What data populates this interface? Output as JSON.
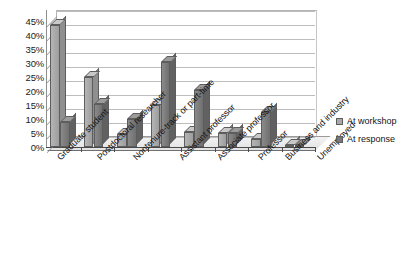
{
  "chart_data": {
    "type": "bar",
    "title": "",
    "xlabel": "",
    "ylabel": "",
    "ylim": [
      0,
      45
    ],
    "ytick_step": 5,
    "grid": true,
    "legend_position": "right",
    "style": "3d-clustered-column",
    "categories": [
      "Graduate student",
      "Postdoctoral researcher",
      "Nontenure-track or part-time",
      "Assistant professor",
      "Associate professor",
      "Professor",
      "Business and industry",
      "Unemployed"
    ],
    "ytick_labels": [
      "0%",
      "5%",
      "10%",
      "15%",
      "20%",
      "25%",
      "30%",
      "35%",
      "40%",
      "45%"
    ],
    "series": [
      {
        "name": "At workshop",
        "color": "#a8a8a8",
        "values": [
          43.5,
          25.0,
          4.5,
          15.0,
          5.5,
          5.0,
          3.0,
          0.7
        ]
      },
      {
        "name": "At response",
        "color": "#787878",
        "values": [
          9.0,
          15.5,
          10.0,
          30.5,
          20.5,
          5.0,
          12.5,
          0.7
        ]
      }
    ]
  },
  "legend": {
    "items": [
      {
        "label": "At workshop",
        "color": "#a8a8a8"
      },
      {
        "label": "At response",
        "color": "#787878"
      }
    ]
  }
}
